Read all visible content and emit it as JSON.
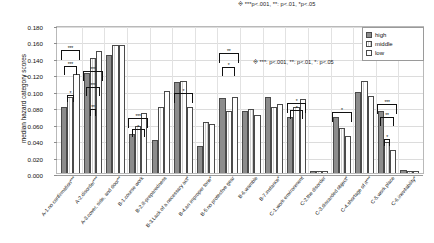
{
  "figure": {
    "ylabel": "median hazard category scores",
    "note_top": "※  ***p<.001, **: p<.01, *p<.05",
    "note_inner": "※   ***: p<.001, **: p<.01, *: p<.05"
  },
  "legend": {
    "items": [
      {
        "label": "high",
        "key": "high"
      },
      {
        "label": "middle",
        "key": "middle"
      },
      {
        "label": "low",
        "key": "low"
      }
    ]
  },
  "chart_data": {
    "type": "bar",
    "title": "",
    "xlabel": "",
    "ylabel": "median hazard category scores",
    "ylim": [
      0,
      0.18
    ],
    "yticks": [
      "0.000",
      "0.020",
      "0.040",
      "0.060",
      "0.080",
      "0.100",
      "0.120",
      "0.140",
      "0.160",
      "0.180"
    ],
    "ytick_values": [
      0.0,
      0.02,
      0.04,
      0.06,
      0.08,
      0.1,
      0.12,
      0.14,
      0.16,
      0.18
    ],
    "grid": true,
    "legend_position": "top-right",
    "categories": [
      "A-1.no confirmation***",
      "A-2.disorder***",
      "A-3.cover, side, and door**",
      "B-1.course work",
      "B-2.ill-preparedness",
      "B-3.Lack of a necessary act*",
      "B-4.an improper tone*",
      "B-5.no protective gear",
      "B-6.wamble",
      "B-7.instance*",
      "C-1.work environment",
      "C-2.the disorder",
      "C-3.discarded object*",
      "C-4.shortage of it***",
      "C-5.work place",
      "C-6.inevitability*"
    ],
    "series": [
      {
        "name": "high",
        "values": [
          0.08,
          0.122,
          0.143,
          0.048,
          0.04,
          0.111,
          0.033,
          0.091,
          0.076,
          0.093,
          0.068,
          0.121,
          0.098,
          0.152,
          0.145,
          0.154
        ]
      },
      {
        "name": "middle",
        "values": [
          0.092,
          0.14,
          0.156,
          0.057,
          0.08,
          0.112,
          0.062,
          0.076,
          0.078,
          0.08,
          0.08,
          0.15,
          0.101,
          0.121,
          0.1,
          0.1
        ]
      },
      {
        "name": "low",
        "values": [
          0.121,
          0.148,
          0.156,
          0.073,
          0.1,
          0.08,
          0.06,
          0.092,
          0.071,
          0.084,
          0.09,
          0.121,
          0.102,
          0.14,
          0.112,
          0.113
        ]
      }
    ],
    "group_count": 15,
    "groups": [
      {
        "label": "A-1.no confirmation***",
        "high": 0.08,
        "middle": 0.092,
        "low": 0.121,
        "brackets": [
          {
            "from": "high",
            "to": "low",
            "stars": "***",
            "level": 0.152
          },
          {
            "from": "high",
            "to": "middle",
            "stars": "***",
            "level": 0.132
          },
          {
            "from": "high",
            "to": "middle",
            "stars": "*",
            "level": 0.097
          }
        ]
      },
      {
        "label": "A-2.disorder***",
        "high": 0.122,
        "middle": 0.14,
        "low": 0.148,
        "brackets": [
          {
            "from": "high",
            "to": "low",
            "stars": "***",
            "level": 0.126
          },
          {
            "from": "high",
            "to": "middle",
            "stars": "***",
            "level": 0.107
          },
          {
            "from": "high",
            "to": "middle",
            "stars": "**",
            "level": 0.08
          }
        ]
      },
      {
        "label": "A-3.cover, side, and door**",
        "high": 0.143,
        "middle": 0.156,
        "low": 0.156,
        "brackets": []
      },
      {
        "label": "B-1.course work",
        "high": 0.048,
        "middle": 0.057,
        "low": 0.073,
        "brackets": [
          {
            "from": "high",
            "to": "low",
            "stars": "***",
            "level": 0.069
          },
          {
            "from": "high",
            "to": "middle",
            "stars": "*",
            "level": 0.056
          }
        ]
      },
      {
        "label": "B-2.ill-preparedness",
        "high": 0.04,
        "middle": 0.08,
        "low": 0.1,
        "brackets": []
      },
      {
        "label": "B-3.Lack of a necessary act*",
        "high": 0.111,
        "middle": 0.112,
        "low": 0.08,
        "brackets": [
          {
            "from": "high",
            "to": "low",
            "stars": "*",
            "level": 0.1
          }
        ]
      },
      {
        "label": "B-4.an improper tone*",
        "high": 0.033,
        "middle": 0.062,
        "low": 0.06,
        "brackets": []
      },
      {
        "label": "B-5.no protective gear",
        "high": 0.091,
        "middle": 0.076,
        "low": 0.092,
        "brackets": [
          {
            "from": "high",
            "to": "low",
            "stars": "**",
            "level": 0.148
          },
          {
            "from": "high",
            "to": "middle",
            "stars": "*",
            "level": 0.131
          }
        ]
      },
      {
        "label": "B-6.wamble",
        "high": 0.076,
        "middle": 0.078,
        "low": 0.071,
        "brackets": []
      },
      {
        "label": "B-7.instance*",
        "high": 0.093,
        "middle": 0.08,
        "low": 0.084,
        "brackets": []
      },
      {
        "label": "C-1.work environment",
        "high": 0.068,
        "middle": 0.08,
        "low": 0.09,
        "brackets": [
          {
            "from": "high",
            "to": "low",
            "stars": "*",
            "level": 0.087
          },
          {
            "from": "high",
            "to": "middle",
            "stars": "*",
            "level": 0.079
          }
        ]
      },
      {
        "label": "C-2.the disorder",
        "high": 0.003,
        "middle": 0.002,
        "low": 0.002,
        "brackets": []
      },
      {
        "label": "C-3.discarded object*",
        "high": 0.068,
        "middle": 0.055,
        "low": 0.045,
        "brackets": [
          {
            "from": "high",
            "to": "low",
            "stars": "*",
            "level": 0.077
          }
        ]
      },
      {
        "label": "C-4.shortage of it***",
        "high": 0.098,
        "middle": 0.112,
        "low": 0.094,
        "brackets": []
      },
      {
        "label": "C-5.work place",
        "high": 0.075,
        "middle": 0.038,
        "low": 0.028,
        "brackets": [
          {
            "from": "high",
            "to": "low",
            "stars": "***",
            "level": 0.086
          },
          {
            "from": "high",
            "to": "middle",
            "stars": "**",
            "level": 0.07
          },
          {
            "from": "high",
            "to": "middle",
            "stars": "*",
            "level": 0.044
          }
        ]
      },
      {
        "label": "C-6.inevitability*",
        "high": 0.004,
        "middle": 0.003,
        "low": 0.003,
        "brackets": []
      }
    ]
  }
}
